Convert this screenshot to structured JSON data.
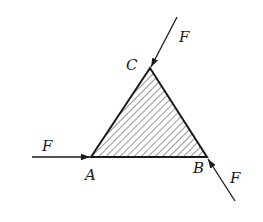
{
  "diagram": {
    "type": "force-diagram",
    "shape": "triangle",
    "fill": "hatched",
    "colors": {
      "stroke": "#1a1a1a",
      "hatch": "#333333",
      "background": "#ffffff"
    },
    "vertices": {
      "A": {
        "label": "A",
        "x": 91,
        "y": 157
      },
      "B": {
        "label": "B",
        "x": 207,
        "y": 157
      },
      "C": {
        "label": "C",
        "x": 150,
        "y": 68
      }
    },
    "forces": [
      {
        "id": "F_A",
        "label": "F",
        "applied_at": "A",
        "direction": "horizontal, pointing right into A"
      },
      {
        "id": "F_C",
        "label": "F",
        "applied_at": "C",
        "direction": "down-left into C, along line BC extended"
      },
      {
        "id": "F_B",
        "label": "F",
        "applied_at": "B",
        "direction": "up-left into B"
      }
    ]
  }
}
